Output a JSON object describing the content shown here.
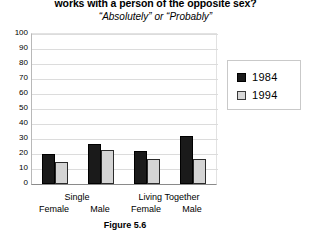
{
  "title": {
    "main": "works with a person of the opposite sex?",
    "sub": "“Absolutely” or “Probably”"
  },
  "caption": "Figure 5.6",
  "legend": {
    "position": "right",
    "entries": [
      {
        "label": "1984",
        "color": "#1a1a1a",
        "icon": "filled-square-icon"
      },
      {
        "label": "1994",
        "color": "#d8d8d8",
        "icon": "light-square-icon"
      }
    ]
  },
  "yaxis": {
    "ticks": [
      "100",
      "90",
      "80",
      "70",
      "60",
      "50",
      "40",
      "30",
      "20",
      "10",
      "0"
    ]
  },
  "xaxis": {
    "groups": [
      "Single",
      "Living Together"
    ],
    "items": [
      "Female",
      "Male",
      "Female",
      "Male"
    ]
  },
  "chart_data": {
    "type": "bar",
    "title": "works with a person of the opposite sex?",
    "subtitle": "“Absolutely” or “Probably”",
    "caption": "Figure 5.6",
    "xlabel": "",
    "ylabel": "",
    "ylim": [
      0,
      100
    ],
    "ytick_step": 10,
    "grid": true,
    "legend_position": "right",
    "categories": [
      "Single / Female",
      "Single / Male",
      "Living Together / Female",
      "Living Together / Male"
    ],
    "group_labels": [
      "Single",
      "Living Together"
    ],
    "subgroup_labels": [
      "Female",
      "Male"
    ],
    "series": [
      {
        "name": "1984",
        "color": "#1a1a1a",
        "values": [
          20,
          27,
          22,
          32
        ]
      },
      {
        "name": "1994",
        "color": "#d8d8d8",
        "values": [
          15,
          23,
          17,
          17
        ]
      }
    ]
  }
}
